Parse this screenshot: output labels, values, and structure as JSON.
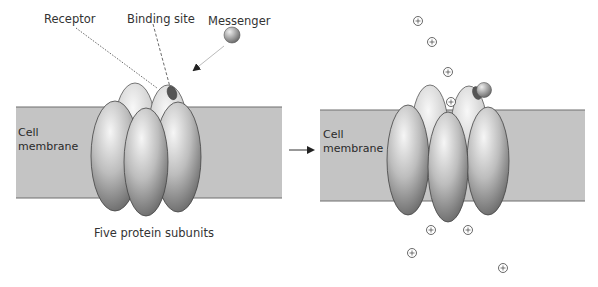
{
  "figure": {
    "left_panel": {
      "labels": {
        "receptor": "Receptor",
        "binding_site": "Binding site",
        "messenger": "Messenger",
        "membrane_line1": "Cell",
        "membrane_line2": "membrane",
        "caption": "Five protein subunits"
      }
    },
    "right_panel": {
      "labels": {
        "membrane_line1": "Cell",
        "membrane_line2": "membrane"
      },
      "ion_symbol": "+",
      "ions_above": 4,
      "ions_below": 4
    },
    "colors": {
      "membrane": "#c4c4c4",
      "membrane_edge": "#6e6e6e",
      "protein_light": "#f0f0f0",
      "protein_dark": "#5a5a5a",
      "binding_site": "#555555",
      "text": "#333333"
    }
  }
}
